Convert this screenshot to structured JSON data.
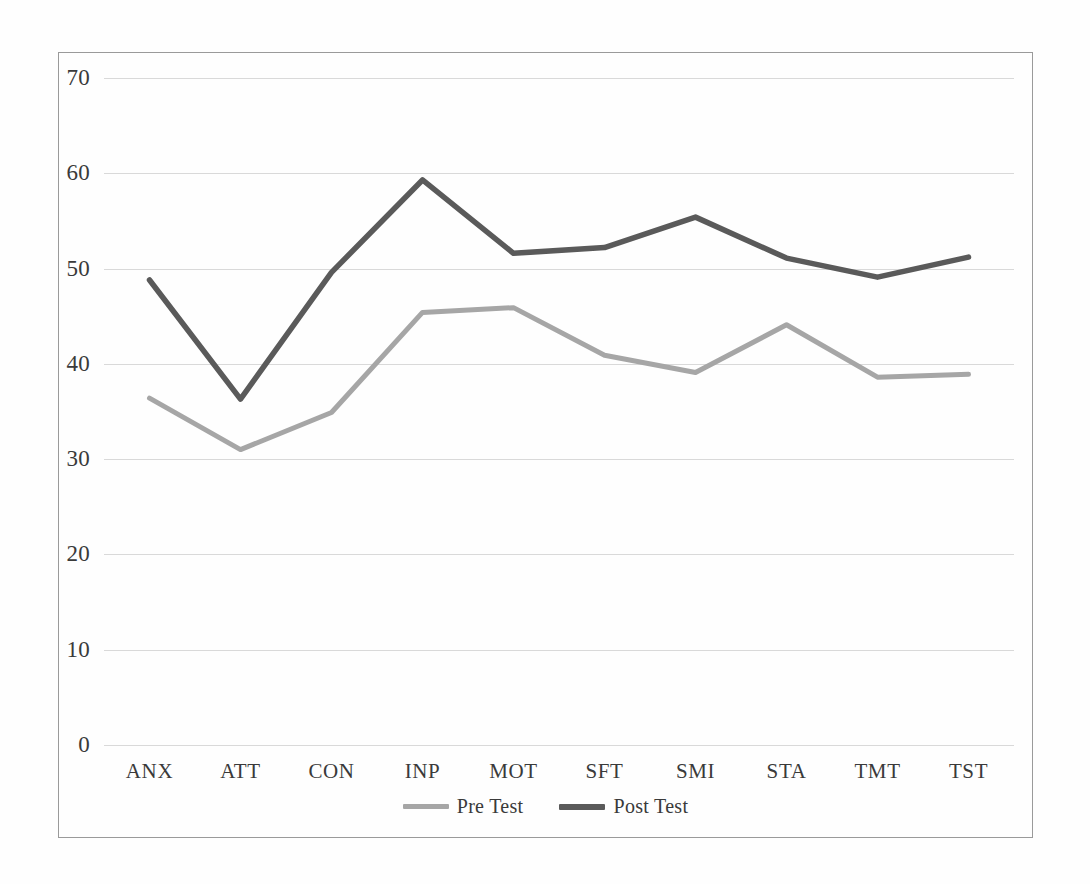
{
  "chart_data": {
    "type": "line",
    "title": "",
    "subtitle": "",
    "xlabel": "",
    "ylabel": "",
    "categories": [
      "ANX",
      "ATT",
      "CON",
      "INP",
      "MOT",
      "SFT",
      "SMI",
      "STA",
      "TMT",
      "TST"
    ],
    "series": [
      {
        "name": "Pre Test",
        "color": "#a6a6a6",
        "values": [
          36.4,
          31.0,
          34.9,
          45.4,
          45.9,
          40.9,
          39.1,
          44.1,
          38.6,
          38.9
        ]
      },
      {
        "name": "Post Test",
        "color": "#5a5a5a",
        "values": [
          48.8,
          36.3,
          49.6,
          59.3,
          51.6,
          52.2,
          55.4,
          51.1,
          49.1,
          51.2
        ]
      }
    ],
    "ylim": [
      0,
      70
    ],
    "ytick_step": 10,
    "yticks": [
      70,
      60,
      50,
      40,
      30,
      20,
      10,
      0
    ],
    "grid": true,
    "grid_color": "#d9d9d9",
    "grid_axis": "y",
    "legend_position": "bottom",
    "frame_color": "#9a9a9a",
    "background": "#ffffff"
  },
  "legend": {
    "items": [
      {
        "label": "Pre Test",
        "color": "#a6a6a6"
      },
      {
        "label": "Post Test",
        "color": "#5a5a5a"
      }
    ]
  }
}
